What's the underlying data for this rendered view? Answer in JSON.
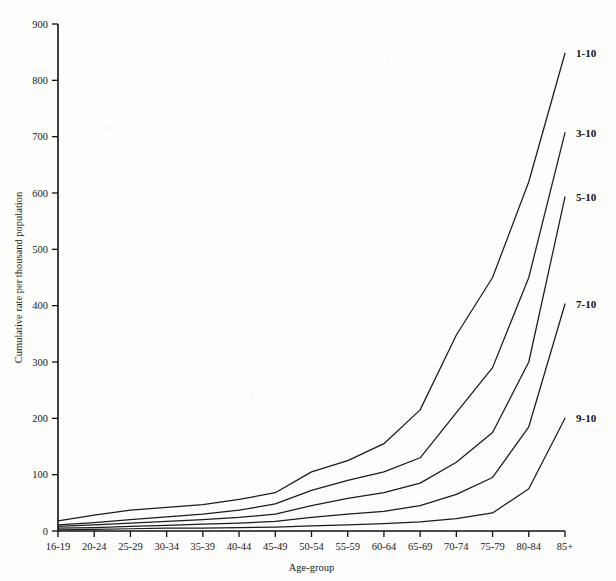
{
  "chart_data": {
    "type": "line",
    "title": "",
    "xlabel": "Age-group",
    "ylabel": "Cumulative rate per thousand population",
    "categories": [
      "16-19",
      "20-24",
      "25-29",
      "30-34",
      "35-39",
      "40-44",
      "45-49",
      "50-54",
      "55-59",
      "60-64",
      "65-69",
      "70-74",
      "75-79",
      "80-84",
      "85+"
    ],
    "ylim": [
      0,
      900
    ],
    "yticks": [
      0,
      100,
      200,
      300,
      400,
      500,
      600,
      700,
      800,
      900
    ],
    "grid": false,
    "legend_position": "inline-right-end-of-line",
    "series": [
      {
        "name": "1-10",
        "values": [
          18,
          28,
          37,
          42,
          47,
          56,
          68,
          105,
          125,
          155,
          215,
          348,
          450,
          620,
          848
        ]
      },
      {
        "name": "3-10",
        "values": [
          11,
          15,
          20,
          25,
          30,
          37,
          48,
          72,
          90,
          105,
          130,
          210,
          290,
          450,
          707
        ]
      },
      {
        "name": "5-10",
        "values": [
          8,
          11,
          14,
          17,
          20,
          24,
          30,
          45,
          58,
          68,
          85,
          122,
          175,
          300,
          593
        ]
      },
      {
        "name": "7-10",
        "values": [
          5,
          6,
          8,
          10,
          12,
          14,
          17,
          24,
          30,
          35,
          45,
          65,
          95,
          185,
          403
        ]
      },
      {
        "name": "9-10",
        "values": [
          2,
          3,
          4,
          5,
          5,
          6,
          7,
          9,
          11,
          13,
          16,
          22,
          32,
          75,
          200
        ]
      }
    ]
  },
  "axis": {
    "y_label": "Cumulative rate per thousand population",
    "x_label": "Age-group",
    "y_ticks": [
      "0",
      "100",
      "200",
      "300",
      "400",
      "500",
      "600",
      "700",
      "800",
      "900"
    ],
    "x_ticks": [
      "16-19",
      "20-24",
      "25-29",
      "30-34",
      "35-39",
      "40-44",
      "45-49",
      "50-54",
      "55-59",
      "60-64",
      "65-69",
      "70-74",
      "75-79",
      "80-84",
      "85+"
    ]
  },
  "colors": {
    "line": "#1b1b1b",
    "axis": "#111111",
    "background": "#fdfdfc"
  }
}
